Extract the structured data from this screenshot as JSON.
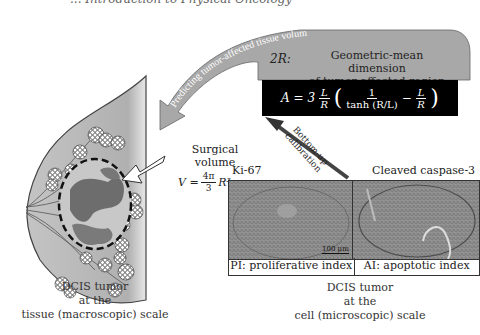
{
  "header": {
    "partial_title": "... Introduction to Physical Oncology"
  },
  "macro": {
    "caption_lines": [
      "DCIS tumor",
      "at the",
      "tissue (macroscopic) scale"
    ]
  },
  "micro": {
    "left_panel_title": "Ki-67",
    "right_panel_title": "Cleaved caspase-3",
    "scale_bar": "100 μm",
    "left_index": "PI: proliferative index",
    "right_index": "AI: apoptotic index",
    "caption_lines": [
      "DCIS tumor",
      "at the",
      "cell (microscopic) scale"
    ]
  },
  "top_box": {
    "symbol": "2R:",
    "description_lines": [
      "Geometric-mean dimension",
      "of tumor-affected region"
    ],
    "formula": {
      "lhs": "A = 3",
      "frac1_num": "L",
      "frac1_den": "R",
      "inner_num": "1",
      "inner_den": "tanh (R/L)",
      "minus": "−",
      "frac2_num": "L",
      "frac2_den": "R"
    }
  },
  "arrows": {
    "curved_label": "Predicting tumor-affected tissue volumes",
    "calibration_label_lines": [
      "Bottom-up",
      "calibration"
    ]
  },
  "surgical": {
    "label_lines": [
      "Surgical",
      "volume"
    ],
    "formula_lhs": "V =",
    "formula_num": "4π",
    "formula_den": "3",
    "formula_rhs": "R³"
  },
  "colors": {
    "tissue_gray": "#b5b5b5",
    "arrow_gray": "#a8a8a8",
    "formula_bg": "#000000",
    "tumor_dark": "#6d6d6d",
    "tumor_light": "#c8c8c8"
  }
}
